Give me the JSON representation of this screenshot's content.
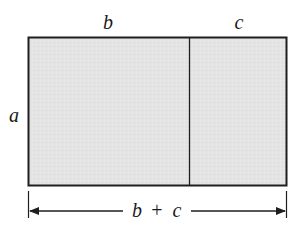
{
  "diagram": {
    "type": "area-model-rectangle",
    "colors": {
      "fill": "#e4e4e4",
      "stroke": "#1e1e1e",
      "text": "#1a1a1a",
      "background": "#ffffff"
    },
    "labels": {
      "top_left": "b",
      "top_right": "c",
      "left_side": "a",
      "bottom_b": "b",
      "bottom_plus": "+",
      "bottom_c": "c"
    },
    "bottom_dimension": "b + c",
    "regions": [
      {
        "name": "region-b",
        "width_label": "b",
        "height_label": "a"
      },
      {
        "name": "region-c",
        "width_label": "c",
        "height_label": "a"
      }
    ]
  }
}
